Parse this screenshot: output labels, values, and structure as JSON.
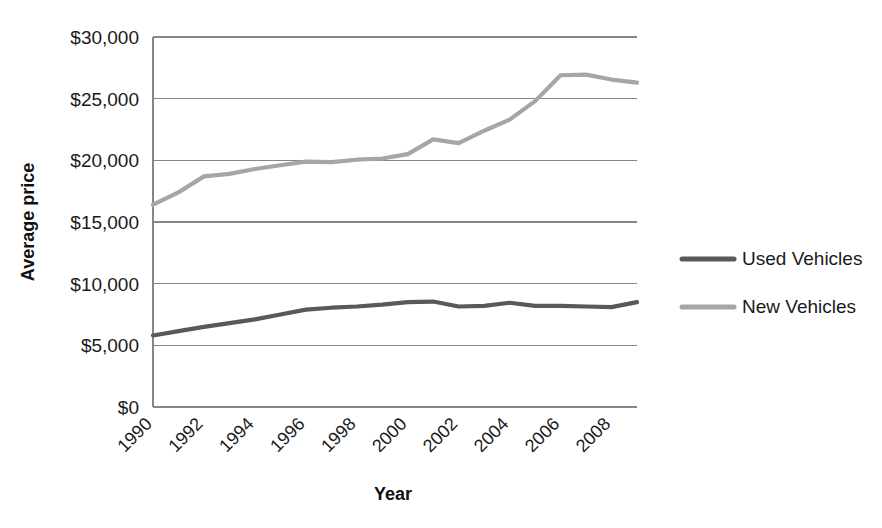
{
  "chart_data": {
    "type": "line",
    "title": "",
    "xlabel": "Year",
    "ylabel": "Average price",
    "x": [
      1990,
      1991,
      1992,
      1993,
      1994,
      1995,
      1996,
      1997,
      1998,
      1999,
      2000,
      2001,
      2002,
      2003,
      2004,
      2005,
      2006,
      2007,
      2008,
      2009
    ],
    "xtick_labels": [
      "1990",
      "1992",
      "1994",
      "1996",
      "1998",
      "2000",
      "2002",
      "2004",
      "2006",
      "2008"
    ],
    "xtick_values": [
      1990,
      1992,
      1994,
      1996,
      1998,
      2000,
      2002,
      2004,
      2006,
      2008
    ],
    "ytick_labels": [
      "$0",
      "$5,000",
      "$10,000",
      "$15,000",
      "$20,000",
      "$25,000",
      "$30,000"
    ],
    "ytick_values": [
      0,
      5000,
      10000,
      15000,
      20000,
      25000,
      30000
    ],
    "ylim": [
      0,
      30000
    ],
    "xlim": [
      1990,
      2009
    ],
    "grid": true,
    "legend_position": "right",
    "series": [
      {
        "name": "Used Vehicles",
        "color": "#595959",
        "values": [
          5800,
          6150,
          6500,
          6800,
          7100,
          7500,
          7900,
          8050,
          8150,
          8300,
          8500,
          8550,
          8150,
          8200,
          8450,
          8200,
          8200,
          8150,
          8100,
          8500
        ]
      },
      {
        "name": "New Vehicles",
        "color": "#a6a6a6",
        "values": [
          16400,
          17400,
          18700,
          18900,
          19300,
          19600,
          19900,
          19850,
          20050,
          20150,
          20500,
          21700,
          21400,
          22400,
          23300,
          24800,
          26900,
          26950,
          26550,
          26300
        ]
      }
    ]
  },
  "legend": {
    "items": [
      {
        "label": "Used Vehicles",
        "color": "#595959"
      },
      {
        "label": "New Vehicles",
        "color": "#a6a6a6"
      }
    ]
  },
  "axes": {
    "y_title": "Average price",
    "x_title": "Year"
  }
}
